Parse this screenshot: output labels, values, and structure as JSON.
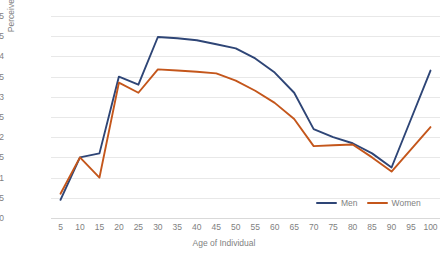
{
  "chart_data": {
    "type": "line",
    "title": "",
    "xlabel": "Age of Individual",
    "ylabel": "Perceived Status",
    "categories": [
      "5",
      "10",
      "15",
      "20",
      "25",
      "30",
      "35",
      "40",
      "45",
      "50",
      "55",
      "60",
      "65",
      "70",
      "75",
      "80",
      "85",
      "90",
      "95",
      "100"
    ],
    "x": [
      5,
      10,
      15,
      20,
      25,
      30,
      35,
      40,
      45,
      50,
      55,
      60,
      65,
      70,
      75,
      80,
      85,
      90,
      95,
      100
    ],
    "series": [
      {
        "name": "Men",
        "color": "#2E4576",
        "values": [
          0.45,
          1.5,
          1.6,
          3.5,
          3.3,
          4.48,
          4.45,
          4.4,
          4.3,
          4.2,
          3.95,
          3.6,
          3.1,
          2.2,
          2.0,
          1.85,
          1.6,
          1.25,
          2.45,
          3.65
        ]
      },
      {
        "name": "Women",
        "color": "#C4561B",
        "values": [
          0.6,
          1.5,
          1.0,
          3.35,
          3.1,
          3.68,
          3.65,
          3.62,
          3.58,
          3.4,
          3.15,
          2.85,
          2.45,
          1.78,
          1.8,
          1.82,
          1.5,
          1.15,
          1.7,
          2.25
        ]
      }
    ],
    "ylim": [
      0,
      5
    ],
    "yticks": [
      "0",
      "0.5",
      "1",
      "1.5",
      "2",
      "2.5",
      "3",
      "3.5",
      "4",
      "4.5",
      "5"
    ],
    "ytick_values": [
      0,
      0.5,
      1,
      1.5,
      2,
      2.5,
      3,
      3.5,
      4,
      4.5,
      5
    ],
    "grid": "horizontal",
    "legend_position": "bottom-right",
    "background": "#ffffff",
    "gridline_color": "#e8e8e8"
  }
}
